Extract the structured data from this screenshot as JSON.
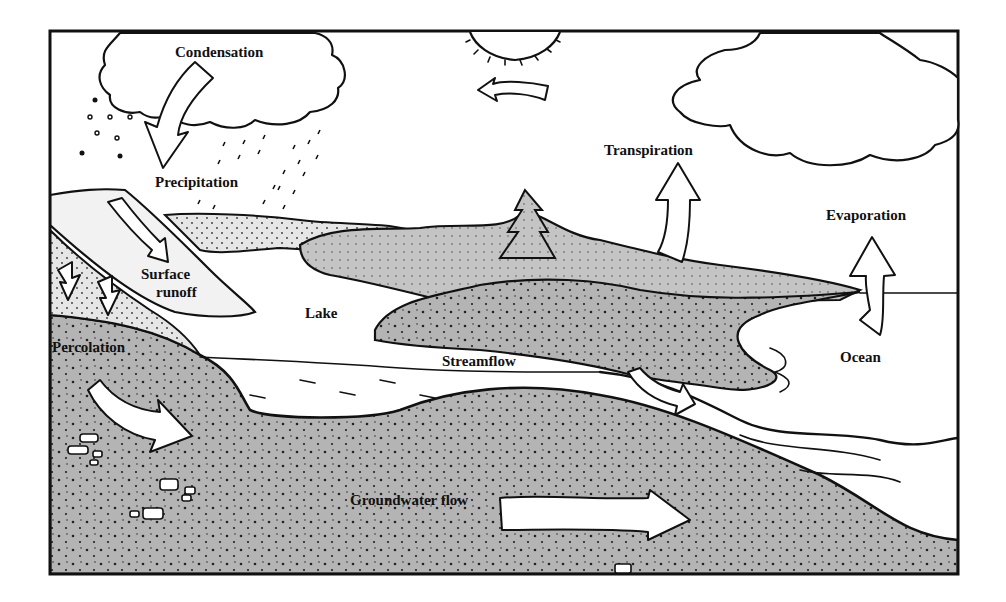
{
  "diagram": {
    "labels": {
      "condensation": "Condensation",
      "precipitation": "Precipitation",
      "transpiration": "Transpiration",
      "evaporation": "Evaporation",
      "surface_runoff_line1": "Surface",
      "surface_runoff_line2": "runoff",
      "lake": "Lake",
      "percolation": "Percolation",
      "streamflow": "Streamflow",
      "ocean": "Ocean",
      "groundwater_flow": "Groundwater flow"
    },
    "colors": {
      "ink": "#111111",
      "ground_gray": "#a8a8a8",
      "vegetation_gray": "#c9c9c9",
      "paper": "#ffffff"
    }
  }
}
